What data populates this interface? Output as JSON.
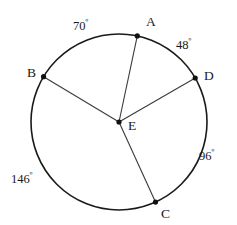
{
  "figure": {
    "shape": "circle",
    "stroke_color": "#1a1a1a",
    "background": "#ffffff",
    "center_label": "E",
    "radius_px": 88,
    "center_px": [
      119,
      122
    ]
  },
  "points": [
    {
      "name": "A",
      "label": "A",
      "angle_deg": 78,
      "label_x": 146,
      "label_y": 15
    },
    {
      "name": "B",
      "label": "B",
      "angle_deg": 149,
      "label_x": 27,
      "label_y": 66
    },
    {
      "name": "D",
      "label": "D",
      "angle_deg": 30,
      "label_x": 204,
      "label_y": 69
    },
    {
      "name": "C",
      "label": "C",
      "angle_deg": 294.5,
      "label_x": 161,
      "label_y": 207
    },
    {
      "name": "E",
      "label": "E",
      "angle_deg": null,
      "label_x": 128,
      "label_y": 119
    }
  ],
  "radii": [
    {
      "name": "radius-EA",
      "from": "E",
      "to": "A"
    },
    {
      "name": "radius-EB",
      "from": "E",
      "to": "B"
    },
    {
      "name": "radius-ED",
      "from": "E",
      "to": "D"
    },
    {
      "name": "radius-EC",
      "from": "E",
      "to": "C"
    }
  ],
  "arc_measures": [
    {
      "name": "arc-AB",
      "value": "70",
      "degree_symbol": "º",
      "label_x": 73,
      "label_y": 20
    },
    {
      "name": "arc-AD",
      "value": "48",
      "degree_symbol": "º",
      "label_x": 176,
      "label_y": 39
    },
    {
      "name": "arc-DC",
      "value": "96",
      "degree_symbol": "º",
      "label_x": 199,
      "label_y": 150
    },
    {
      "name": "arc-CB",
      "value": "146",
      "degree_symbol": "º",
      "label_x": 11,
      "label_y": 173
    }
  ],
  "chart_data": {
    "type": "pie",
    "title": "",
    "categories": [
      "arc AB",
      "arc AD",
      "arc DC",
      "arc CB"
    ],
    "values": [
      70,
      48,
      96,
      146
    ],
    "unit": "degrees",
    "total": 360,
    "xlabel": "",
    "ylabel": "",
    "legend": "none",
    "grid": false
  }
}
